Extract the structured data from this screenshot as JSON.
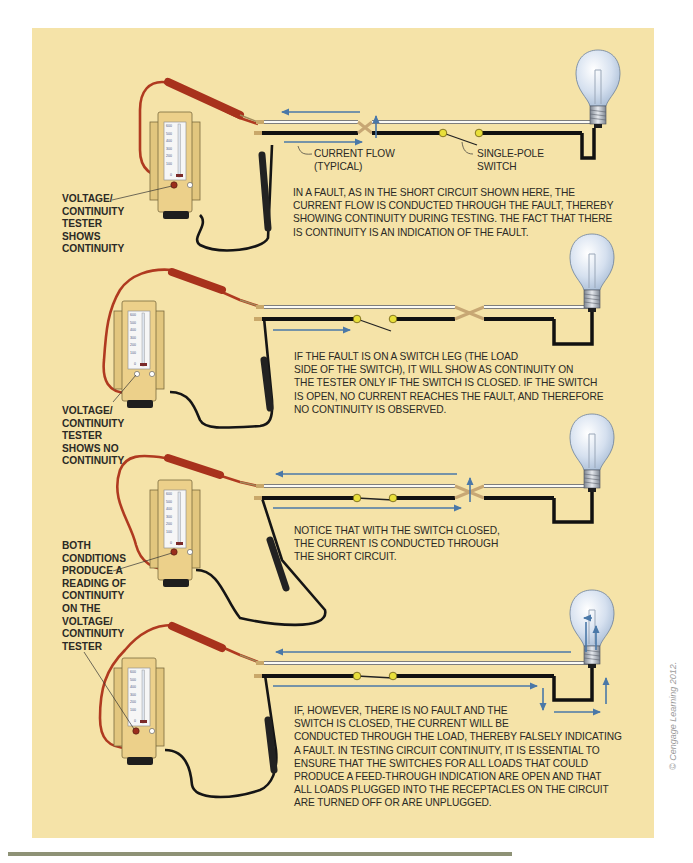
{
  "figure": {
    "background_color": "#f5e3a8",
    "colors": {
      "hot_wire": "#161616",
      "neutral_wire": "#ffffff",
      "current_arrow": "#4a78a8",
      "red_lead": "#b03a20",
      "black_lead": "#1a1a1a",
      "tester_body": "#e6c983",
      "switch_terminal": "#e8df3a"
    },
    "credit": "© Cengage Learning 2012.",
    "panels": [
      {
        "id": "panel-1",
        "tester_label": "VOLTAGE/\nCONTINUITY\nTESTER\nSHOWS\nCONTINUITY",
        "callout_current_flow": "CURRENT FLOW\n(TYPICAL)",
        "callout_switch": "SINGLE-POLE\nSWITCH",
        "switch_state": "open",
        "fault": "short circuit",
        "description": "IN A FAULT, AS IN THE SHORT CIRCUIT SHOWN HERE, THE\nCURRENT FLOW IS CONDUCTED THROUGH THE FAULT, THEREBY\nSHOWING CONTINUITY DURING TESTING. THE FACT THAT THERE\nIS CONTINUITY IS AN INDICATION OF THE FAULT."
      },
      {
        "id": "panel-2",
        "tester_label": "VOLTAGE/\nCONTINUITY\nTESTER\nSHOWS NO\nCONTINUITY",
        "switch_state": "open",
        "fault": "switch leg",
        "description": "IF THE FAULT IS ON A SWITCH LEG (THE LOAD\nSIDE OF THE SWITCH), IT WILL SHOW AS CONTINUITY ON\nTHE TESTER ONLY IF THE SWITCH IS CLOSED. IF THE SWITCH\nIS OPEN, NO CURRENT REACHES THE FAULT, AND THEREFORE\nNO CONTINUITY IS OBSERVED."
      },
      {
        "id": "panel-3",
        "switch_state": "closed",
        "fault": "short circuit",
        "description": "NOTICE THAT WITH THE SWITCH CLOSED,\nTHE CURRENT IS CONDUCTED THROUGH\nTHE SHORT CIRCUIT."
      },
      {
        "id": "panel-4",
        "switch_state": "closed",
        "fault": "none",
        "description": "IF, HOWEVER, THERE IS NO FAULT AND THE\nSWITCH IS CLOSED, THE CURRENT WILL BE\nCONDUCTED THROUGH THE LOAD, THEREBY FALSELY INDICATING\nA FAULT. IN TESTING CIRCUIT CONTINUITY, IT IS ESSENTIAL TO\nENSURE THAT THE SWITCHES FOR ALL LOADS THAT COULD\nPRODUCE A FEED-THROUGH INDICATION ARE OPEN AND THAT\nALL LOADS PLUGGED INTO THE RECEPTACLES ON THE CIRCUIT\nARE TURNED OFF OR ARE UNPLUGGED."
      }
    ],
    "shared_label": "BOTH\nCONDITIONS\nPRODUCE A\nREADING OF\nCONTINUITY\nON THE\nVOLTAGE/\nCONTINUITY\nTESTER",
    "meter_scale": [
      "600",
      "500",
      "400",
      "300",
      "200",
      "100",
      "0"
    ]
  }
}
